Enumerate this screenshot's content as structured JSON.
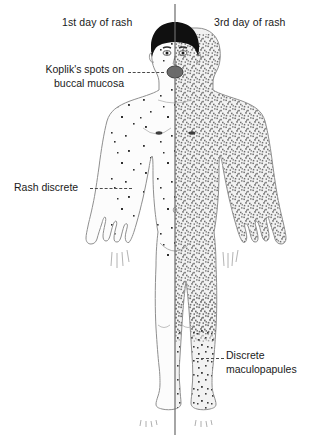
{
  "figure": {
    "background_color": "#ffffff",
    "text_color": "#1a1a1a"
  },
  "captions": {
    "left": "1st day of rash",
    "right": "3rd day of rash"
  },
  "annotations": [
    {
      "id": "koplik",
      "line1": "Koplik's spots on",
      "line2": "buccal mucosa",
      "side": "left",
      "points_to": "mouth"
    },
    {
      "id": "rash-discrete",
      "line1": "Rash discrete",
      "line2": "",
      "side": "left",
      "points_to": "left-forearm"
    },
    {
      "id": "maculopapules",
      "line1": "Discrete",
      "line2": "maculopapules",
      "side": "right",
      "points_to": "right-shin"
    }
  ],
  "divider": {
    "orientation": "vertical",
    "color": "#6a6a6a"
  },
  "body": {
    "skin_outline_color": "#8a8a8a",
    "hair_color": "#101010",
    "mouth_color": "#5a5a5a",
    "left_half_rash": "sparse discrete spots on face, neck, trunk and arm; legs clear",
    "right_half_rash": "dense confluent stippling over face, trunk, arms and legs"
  }
}
